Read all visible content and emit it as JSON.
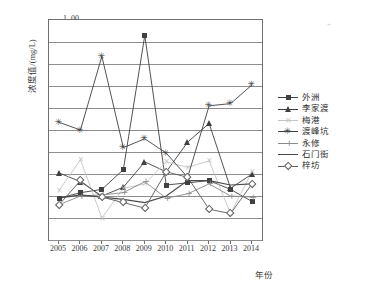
{
  "axes": {
    "ylabel": "浓度值/(mg/L)",
    "xlabel": "年份",
    "yticks": [
      "1. 00",
      "0. 90",
      "0. 80",
      "0. 70",
      "0. 60",
      "0. 50",
      "0. 40",
      "0. 30",
      "0. 20",
      "0. 10",
      "0"
    ],
    "xticks": [
      "2005",
      "2006",
      "2007",
      "2008",
      "2009",
      "2010",
      "2011",
      "2012",
      "2013",
      "2014"
    ]
  },
  "legend": {
    "items": [
      {
        "label": "外洲",
        "marker": "filled-square-icon",
        "color": "#404040"
      },
      {
        "label": "李家渡",
        "marker": "filled-triangle-icon",
        "color": "#404040"
      },
      {
        "label": "梅港",
        "marker": "light-line-icon",
        "color": "#c4c4c4"
      },
      {
        "label": "渡峰坑",
        "marker": "asterisk-icon",
        "color": "#404040"
      },
      {
        "label": "永修",
        "marker": "plus-icon",
        "color": "#8a8a8a"
      },
      {
        "label": "石门街",
        "marker": "plain-line-icon",
        "color": "#4a4a4a"
      },
      {
        "label": "梓坊",
        "marker": "open-diamond-icon",
        "color": "#5a5a5a"
      }
    ]
  },
  "chart_data": {
    "type": "line",
    "title": "",
    "xlabel": "年份",
    "ylabel": "浓度值/(mg/L)",
    "x": [
      2005,
      2006,
      2007,
      2008,
      2009,
      2010,
      2011,
      2012,
      2013,
      2014
    ],
    "categories": [
      "2005",
      "2006",
      "2007",
      "2008",
      "2009",
      "2010",
      "2011",
      "2012",
      "2013",
      "2014"
    ],
    "ylim": [
      0,
      1.0
    ],
    "ytick_values": [
      0,
      0.1,
      0.2,
      0.3,
      0.4,
      0.5,
      0.6,
      0.7,
      0.8,
      0.9,
      1.0
    ],
    "grid": true,
    "legend_position": "right",
    "series": [
      {
        "name": "外洲",
        "marker": "square",
        "color": "#404040",
        "values": [
          0.19,
          0.215,
          0.23,
          0.32,
          0.93,
          0.25,
          0.26,
          0.27,
          0.23,
          0.175
        ]
      },
      {
        "name": "李家渡",
        "marker": "triangle",
        "color": "#404040",
        "values": [
          0.305,
          0.265,
          0.2,
          0.24,
          0.355,
          0.31,
          0.445,
          0.53,
          0.235,
          0.3
        ]
      },
      {
        "name": "梅港",
        "marker": "x",
        "color": "#c4c4c4",
        "values": [
          0.225,
          0.365,
          0.1,
          0.235,
          0.255,
          0.355,
          0.33,
          0.36,
          0.12,
          0.31
        ]
      },
      {
        "name": "渡峰坑",
        "marker": "asterisk",
        "color": "#404040",
        "values": [
          0.535,
          0.5,
          0.835,
          0.42,
          0.46,
          0.395,
          0.285,
          0.61,
          0.62,
          0.705
        ]
      },
      {
        "name": "永修",
        "marker": "plus",
        "color": "#8a8a8a",
        "values": [
          0.16,
          0.2,
          0.205,
          0.215,
          0.265,
          0.19,
          0.21,
          0.255,
          0.2,
          0.195
        ]
      },
      {
        "name": "石门街",
        "marker": "none",
        "color": "#4a4a4a",
        "values": [
          0.19,
          0.205,
          0.195,
          0.185,
          0.17,
          0.2,
          0.27,
          0.27,
          0.25,
          0.255
        ]
      },
      {
        "name": "梓坊",
        "marker": "diamond",
        "color": "#5a5a5a",
        "values": [
          0.16,
          0.27,
          0.195,
          0.17,
          0.145,
          0.31,
          0.285,
          0.14,
          0.12,
          0.255
        ]
      }
    ]
  }
}
